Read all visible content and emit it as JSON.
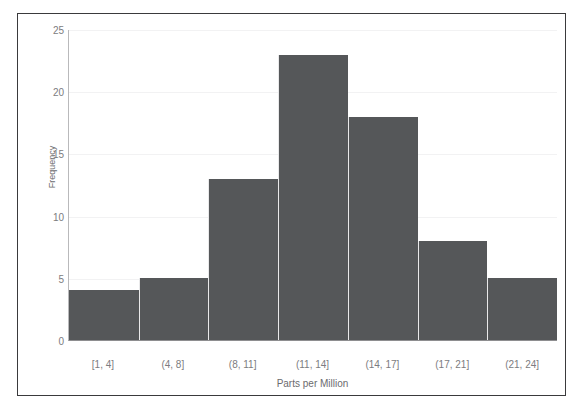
{
  "scan_artifact": {
    "top_strip_text": ""
  },
  "chart_data": {
    "type": "bar",
    "title": "",
    "subtitle": "",
    "xlabel": "Parts per Million",
    "ylabel": "Frequency",
    "categories": [
      "[1, 4]",
      "(4, 8]",
      "(8, 11]",
      "(11, 14]",
      "(14, 17]",
      "(17, 21]",
      "(21, 24]"
    ],
    "values": [
      4,
      5,
      13,
      23,
      18,
      8,
      5
    ],
    "ylim": [
      0,
      25
    ],
    "y_ticks": [
      0,
      5,
      10,
      15,
      20,
      25
    ],
    "y_tick_labels": [
      "0",
      "5",
      "10",
      "15",
      "20",
      "25"
    ],
    "grid": true,
    "legend": false,
    "legend_position": "none",
    "bar_color": "#555759",
    "bar_edge_color": "#e9e9ea",
    "axis_color": "#8e8e90",
    "tick_label_color": "#7c7c80",
    "axis_title_color": "#6b6b6e",
    "frame_border_color": "#3a3a3c",
    "background_color": "#ffffff",
    "bars_contiguous": true
  }
}
